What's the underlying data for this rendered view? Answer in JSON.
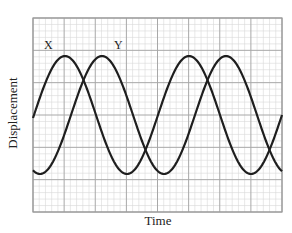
{
  "chart_data": {
    "type": "line",
    "title": "",
    "xlabel": "Time",
    "ylabel": "Displacement",
    "grid": true,
    "legend": "inline labels",
    "x_units": "grid divisions (8 major)",
    "y_units": "grid divisions (6 major, midline at 3)",
    "xlim": [
      0,
      8
    ],
    "ylim": [
      -3,
      3
    ],
    "series": [
      {
        "name": "X",
        "amplitude": 1.85,
        "period": 4.0,
        "phase_zero_crossing_x": 0.0,
        "peaks_x": [
          1.0,
          5.0
        ],
        "troughs_x": [
          3.0,
          7.0
        ]
      },
      {
        "name": "Y",
        "amplitude": 1.85,
        "period": 4.0,
        "phase_zero_crossing_x": 1.2,
        "peaks_x": [
          2.2,
          6.2
        ],
        "troughs_x": [
          0.2,
          4.2
        ]
      }
    ]
  },
  "labels": {
    "series_x": "X",
    "series_y": "Y",
    "xaxis": "Time",
    "yaxis": "Displacement"
  },
  "plot_px": {
    "left": 33,
    "top": 18,
    "right": 282,
    "bottom": 212,
    "mid_y": 115,
    "amp_px": 59,
    "period_px": 124,
    "x_phase_px": 34,
    "y_phase_px": 71
  },
  "colors": {
    "curve": "#1e1e1e",
    "major_grid": "#a8a8a8",
    "minor_grid": "#d8d8d8",
    "frame": "#999999"
  }
}
